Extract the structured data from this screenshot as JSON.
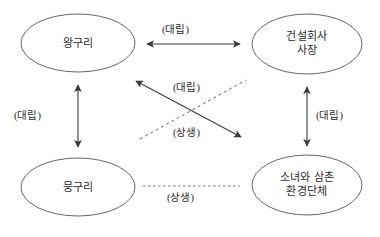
{
  "diagram": {
    "type": "relationship-diagram",
    "background_color": "#ffffff",
    "stroke_color": "#4a4a4a",
    "text_color": "#2b2b2b",
    "nodes": [
      {
        "id": "wangguri",
        "position": "top-left",
        "lines": [
          "왕구리"
        ],
        "line1": "왕구리",
        "line2": "",
        "cx": 78,
        "cy": 43,
        "rx": 57,
        "ry": 29
      },
      {
        "id": "construction-ceo",
        "position": "top-right",
        "lines": [
          "건설회사",
          "사장"
        ],
        "line1": "건설회사",
        "line2": "사장",
        "cx": 307,
        "cy": 44,
        "rx": 55,
        "ry": 30
      },
      {
        "id": "mungguri",
        "position": "bottom-left",
        "lines": [
          "뭉구리"
        ],
        "line1": "뭉구리",
        "line2": "",
        "cx": 78,
        "cy": 187,
        "rx": 57,
        "ry": 29
      },
      {
        "id": "girl-uncle-env-group",
        "position": "bottom-right",
        "lines": [
          "소녀와 삼촌",
          "환경단체"
        ],
        "line1": "소녀와 삼촌",
        "line2": "환경단체",
        "cx": 307,
        "cy": 185,
        "rx": 55,
        "ry": 30
      }
    ],
    "edges": [
      {
        "id": "top-horizontal",
        "from": "wangguri",
        "to": "construction-ceo",
        "label": "(대립)",
        "style": "solid",
        "arrows": "both",
        "label_position": "above-center"
      },
      {
        "id": "left-vertical",
        "from": "wangguri",
        "to": "mungguri",
        "label": "(대립)",
        "style": "solid",
        "arrows": "both",
        "label_position": "left"
      },
      {
        "id": "right-vertical",
        "from": "construction-ceo",
        "to": "girl-uncle-env-group",
        "label": "(대립)",
        "style": "solid",
        "arrows": "both",
        "label_position": "right"
      },
      {
        "id": "diagonal-conflict",
        "from": "wangguri",
        "to": "girl-uncle-env-group",
        "label": "(대립)",
        "style": "solid",
        "arrows": "both",
        "label_position": "upper-center"
      },
      {
        "id": "diagonal-harmony",
        "from": "mungguri",
        "to": "construction-ceo",
        "label": "(상생)",
        "style": "dashed",
        "arrows": "none",
        "label_position": "lower-center"
      },
      {
        "id": "bottom-horizontal",
        "from": "mungguri",
        "to": "girl-uncle-env-group",
        "label": "(상생)",
        "style": "dashed",
        "arrows": "none",
        "label_position": "below-center"
      }
    ]
  }
}
